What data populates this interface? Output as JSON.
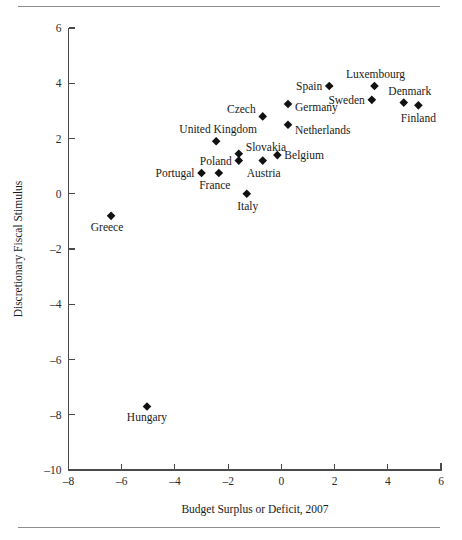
{
  "figure": {
    "has_top_rule": true,
    "has_bottom_rule": true,
    "rule_color": "#8e8e8e",
    "background": "#ffffff",
    "marker_color": "#111111",
    "axis_color": "#4a4a4a"
  },
  "chart_data": {
    "type": "scatter",
    "title": "",
    "subtitle": "",
    "xlabel": "Budget Surplus or Deficit, 2007",
    "ylabel": "Discretionary Fiscal Stimulus",
    "xlim": [
      -8,
      6
    ],
    "ylim": [
      -10,
      6
    ],
    "xticks": [
      -8,
      -6,
      -4,
      -2,
      0,
      2,
      4,
      6
    ],
    "xticklabels": [
      "–8",
      "–6",
      "–4",
      "–2",
      "0",
      "2",
      "4",
      "6"
    ],
    "yticks": [
      -10,
      -8,
      -6,
      -4,
      -2,
      0,
      2,
      4,
      6
    ],
    "yticklabels": [
      "–10",
      "–8",
      "–6",
      "–4",
      "–2",
      "0",
      "2",
      "4",
      "6"
    ],
    "grid": false,
    "legend": "none",
    "marker_shape": "diamond",
    "points": [
      {
        "label": "Greece",
        "x": -6.4,
        "y": -0.8,
        "label_dx": -4,
        "label_dy": 15,
        "anchor": "middle"
      },
      {
        "label": "Hungary",
        "x": -5.05,
        "y": -7.7,
        "label_dx": 0,
        "label_dy": 15,
        "anchor": "middle"
      },
      {
        "label": "Portugal",
        "x": -3.0,
        "y": 0.75,
        "label_dx": -7,
        "label_dy": 4,
        "anchor": "end"
      },
      {
        "label": "France",
        "x": -2.35,
        "y": 0.75,
        "label_dx": -4,
        "label_dy": 16,
        "anchor": "middle"
      },
      {
        "label": "United Kingdom",
        "x": -2.45,
        "y": 1.9,
        "label_dx": 2,
        "label_dy": -8,
        "anchor": "middle"
      },
      {
        "label": "Poland",
        "x": -1.6,
        "y": 1.2,
        "label_dx": -7,
        "label_dy": 4,
        "anchor": "end"
      },
      {
        "label": "Slovakia",
        "x": -1.6,
        "y": 1.45,
        "label_dx": 7,
        "label_dy": -3,
        "anchor": "start"
      },
      {
        "label": "Italy",
        "x": -1.3,
        "y": 0.0,
        "label_dx": 1,
        "label_dy": 16,
        "anchor": "middle"
      },
      {
        "label": "Austria",
        "x": -0.7,
        "y": 1.2,
        "label_dx": 1,
        "label_dy": 16,
        "anchor": "middle"
      },
      {
        "label": "Belgium",
        "x": -0.15,
        "y": 1.4,
        "label_dx": 7,
        "label_dy": 4,
        "anchor": "start"
      },
      {
        "label": "Czech",
        "x": -0.7,
        "y": 2.8,
        "label_dx": -7,
        "label_dy": -3,
        "anchor": "end"
      },
      {
        "label": "Germany",
        "x": 0.25,
        "y": 3.25,
        "label_dx": 7,
        "label_dy": 7,
        "anchor": "start"
      },
      {
        "label": "Netherlands",
        "x": 0.25,
        "y": 2.5,
        "label_dx": 7,
        "label_dy": 9,
        "anchor": "start"
      },
      {
        "label": "Spain",
        "x": 1.8,
        "y": 3.9,
        "label_dx": -7,
        "label_dy": 4,
        "anchor": "end"
      },
      {
        "label": "Luxembourg",
        "x": 3.5,
        "y": 3.9,
        "label_dx": 1,
        "label_dy": -8,
        "anchor": "middle"
      },
      {
        "label": "Sweden",
        "x": 3.4,
        "y": 3.4,
        "label_dx": -7,
        "label_dy": 4,
        "anchor": "end"
      },
      {
        "label": "Denmark",
        "x": 4.6,
        "y": 3.3,
        "label_dx": 6,
        "label_dy": -8,
        "anchor": "middle"
      },
      {
        "label": "Finland",
        "x": 5.15,
        "y": 3.2,
        "label_dx": 0,
        "label_dy": 17,
        "anchor": "middle"
      }
    ]
  }
}
